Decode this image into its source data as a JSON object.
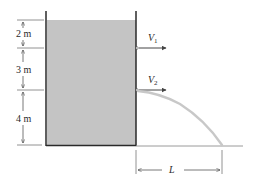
{
  "figure": {
    "tank": {
      "water_color": "#c4c4c4",
      "wall_color": "#2a2a2a"
    },
    "dimensions": [
      {
        "label": "2 m"
      },
      {
        "label": "3 m"
      },
      {
        "label": "4 m"
      }
    ],
    "jets": [
      {
        "label_main": "V",
        "label_sub": "1"
      },
      {
        "label_main": "V",
        "label_sub": "2"
      }
    ],
    "range": {
      "label": "L"
    }
  }
}
